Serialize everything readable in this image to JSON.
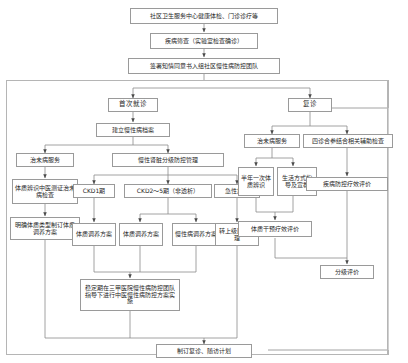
{
  "diagram": {
    "type": "flowchart",
    "title_present": false,
    "language": "zh-CN",
    "theme": {
      "background": "#ffffff",
      "box_border": "#9a9a9a",
      "line": "#8a8a8a",
      "text": "#262626"
    },
    "nodes": {
      "entry": "社区卫生服务中心健康体检、门诊诊疗等",
      "screening": "疾病筛查（实验室检查确诊）",
      "consent": "签署知情同意书入组社区慢性病防控团队",
      "first_visit": "首次就诊",
      "revisit": "复诊",
      "build_record": "建立慢性病档案",
      "preventive_service_left": "治未病服务",
      "ckd_grade_mgmt": "慢性肾脏分级防控管理",
      "tcm_constitution_exam": "体质辨识中医测证治未病检查",
      "constitution_plan_left": "明确体质类型制订体质调养方案",
      "ckd1": "CKD1期",
      "ckd2_5": "CKD2～5期（非透析）",
      "acute_exacerbation": "急性加重",
      "constitution_plan_ckd1": "体质调养方案",
      "constitution_plan_ckd25": "体质调养方案",
      "chronic_plan_ckd25": "慢性病调养方案",
      "refer_hospital": "转上级医院处理",
      "stable_phase": "稳定期在三甲医院慢性病防控团队指导下进行中医慢性病防控方案实施",
      "preventive_service_right": "治未病服务",
      "four_exams": "四诊合参结合相关辅助检查",
      "semiannual_constitution": "半年一次体质辨识",
      "lifestyle_guidance": "生活方式指导及宣教",
      "disease_effect_eval": "疾病防控疗效评价",
      "constitution_effect_eval": "体质干预疗效评价",
      "graded_eval": "分级评价",
      "plan_followup": "制订复诊、随访计划"
    }
  }
}
